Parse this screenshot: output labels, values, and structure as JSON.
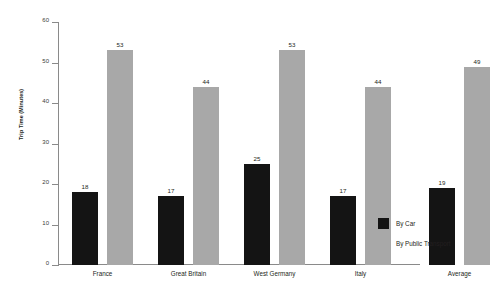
{
  "chart_data": {
    "type": "bar",
    "title": "",
    "subtitle": "",
    "xlabel": "",
    "ylabel": "Trip Time (Minutes)",
    "ylim": [
      0,
      60
    ],
    "ytick_labels": [
      "0",
      "10",
      "20",
      "30",
      "40",
      "50",
      "60"
    ],
    "ytick_values": [
      0,
      10,
      20,
      30,
      40,
      50,
      60
    ],
    "grid": false,
    "legend_position": "right",
    "categories": [
      "France",
      "Great Britain",
      "West Germany",
      "Italy",
      "Average"
    ],
    "series": [
      {
        "name": "By Car",
        "color": "#141414",
        "values": [
          18,
          17,
          25,
          17,
          19
        ],
        "labels": [
          "18",
          "17",
          "25",
          "17",
          "19"
        ]
      },
      {
        "name": "By Public Transport",
        "color": "#a8a8a8",
        "values": [
          53,
          44,
          53,
          44,
          49
        ],
        "labels": [
          "53",
          "44",
          "53",
          "44",
          "49"
        ]
      }
    ]
  },
  "legend": {
    "items": [
      {
        "label": "By Car",
        "swatch": "car"
      },
      {
        "label": "By Public Transport",
        "swatch": "transit"
      }
    ]
  }
}
